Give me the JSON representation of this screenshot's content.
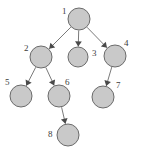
{
  "diagram": {
    "type": "directed-graph",
    "background_color": "#ffffff",
    "node_fill_color": "#c9c9c9",
    "node_stroke_color": "#6b6b6b",
    "edge_color": "#7a7a7a",
    "arrow_color": "#4a4a4a",
    "label_color": "#3c3c3c",
    "nodes": [
      {
        "id": "1",
        "label": "1",
        "cx": 79,
        "cy": 19,
        "r": 11,
        "label_x": 62,
        "label_y": 7
      },
      {
        "id": "2",
        "label": "2",
        "cx": 41,
        "cy": 57,
        "r": 11,
        "label_x": 24,
        "label_y": 44
      },
      {
        "id": "3",
        "label": "3",
        "cx": 78,
        "cy": 57,
        "r": 10,
        "label_x": 92,
        "label_y": 49
      },
      {
        "id": "4",
        "label": "4",
        "cx": 115,
        "cy": 56,
        "r": 11,
        "label_x": 124,
        "label_y": 39
      },
      {
        "id": "5",
        "label": "5",
        "cx": 21,
        "cy": 96,
        "r": 11,
        "label_x": 5,
        "label_y": 78
      },
      {
        "id": "6",
        "label": "6",
        "cx": 59,
        "cy": 96,
        "r": 11,
        "label_x": 65,
        "label_y": 78
      },
      {
        "id": "7",
        "label": "7",
        "cx": 103,
        "cy": 97,
        "r": 11,
        "label_x": 116,
        "label_y": 81
      },
      {
        "id": "8",
        "label": "8",
        "cx": 68,
        "cy": 135,
        "r": 11,
        "label_x": 48,
        "label_y": 130
      }
    ],
    "edges": [
      {
        "from": "1",
        "to": "2",
        "directed": true
      },
      {
        "from": "1",
        "to": "3",
        "directed": true
      },
      {
        "from": "1",
        "to": "4",
        "directed": true
      },
      {
        "from": "2",
        "to": "5",
        "directed": true
      },
      {
        "from": "2",
        "to": "6",
        "directed": true
      },
      {
        "from": "4",
        "to": "7",
        "directed": true
      },
      {
        "from": "6",
        "to": "8",
        "directed": true
      }
    ]
  }
}
